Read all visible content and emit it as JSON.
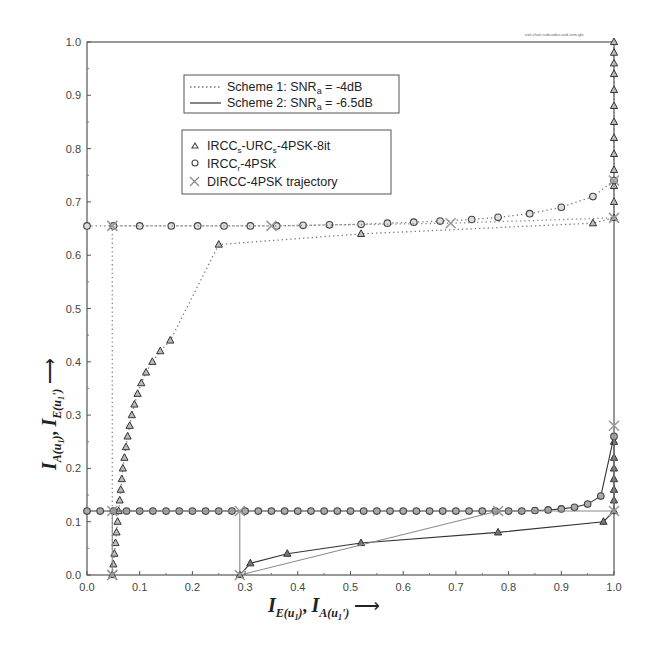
{
  "chart_data": {
    "type": "line",
    "title": "",
    "corner_note": "exit-chart-subcodes-and-sum-glo",
    "xlabel": "I_E(u1), I_A(u1')",
    "ylabel": "I_A(u1), I_E(u1')",
    "xlim": [
      0.0,
      1.0
    ],
    "ylim": [
      0.0,
      1.0
    ],
    "x_ticks": [
      "0.0",
      "0.1",
      "0.2",
      "0.3",
      "0.4",
      "0.5",
      "0.6",
      "0.7",
      "0.8",
      "0.9",
      "1.0"
    ],
    "y_ticks": [
      "0.0",
      "0.1",
      "0.2",
      "0.3",
      "0.4",
      "0.5",
      "0.6",
      "0.7",
      "0.8",
      "0.9",
      "1.0"
    ],
    "grid": false,
    "legend_line_styles": [
      {
        "style": "dotted",
        "label": "Scheme 1: SNR",
        "sub": "a",
        "suffix": " = -4dB"
      },
      {
        "style": "solid",
        "label": "Scheme 2: SNR",
        "sub": "a",
        "suffix": " = -6.5dB"
      }
    ],
    "legend_markers": [
      {
        "marker": "triangle",
        "label": "IRCC_s-URC_s-4PSK-8it"
      },
      {
        "marker": "circle",
        "label": "IRCC_r-4PSK"
      },
      {
        "marker": "x",
        "label": "DIRCC-4PSK trajectory"
      }
    ],
    "series": [
      {
        "name": "Scheme 1 IRCC_s-URC_s-4PSK-8it",
        "style": "dotted",
        "marker": "triangle",
        "x": [
          0.048,
          0.05,
          0.052,
          0.054,
          0.056,
          0.058,
          0.06,
          0.062,
          0.064,
          0.066,
          0.068,
          0.071,
          0.074,
          0.077,
          0.081,
          0.085,
          0.09,
          0.096,
          0.103,
          0.112,
          0.124,
          0.139,
          0.158,
          0.25,
          0.52,
          0.96,
          1.0,
          1.0,
          1.0,
          1.0,
          1.0,
          1.0,
          1.0,
          1.0,
          1.0,
          1.0,
          1.0,
          1.0,
          1.0
        ],
        "y": [
          0.0,
          0.02,
          0.04,
          0.06,
          0.08,
          0.1,
          0.12,
          0.14,
          0.16,
          0.18,
          0.2,
          0.22,
          0.24,
          0.26,
          0.28,
          0.3,
          0.32,
          0.34,
          0.36,
          0.38,
          0.4,
          0.42,
          0.44,
          0.62,
          0.64,
          0.66,
          0.67,
          0.7,
          0.73,
          0.76,
          0.79,
          0.82,
          0.85,
          0.88,
          0.91,
          0.94,
          0.96,
          0.98,
          1.0
        ]
      },
      {
        "name": "Scheme 1 IRCC_r-4PSK",
        "style": "dotted",
        "marker": "circle",
        "x": [
          0.0,
          0.05,
          0.1,
          0.16,
          0.21,
          0.26,
          0.31,
          0.36,
          0.41,
          0.46,
          0.52,
          0.57,
          0.62,
          0.67,
          0.73,
          0.78,
          0.84,
          0.9,
          0.96,
          1.0
        ],
        "y": [
          0.655,
          0.655,
          0.655,
          0.655,
          0.655,
          0.655,
          0.655,
          0.655,
          0.656,
          0.657,
          0.658,
          0.66,
          0.662,
          0.664,
          0.667,
          0.671,
          0.678,
          0.69,
          0.71,
          0.74
        ]
      },
      {
        "name": "Scheme 2 IRCC_s-URC_s-4PSK-8it",
        "style": "solid",
        "marker": "triangle",
        "x": [
          0.29,
          0.31,
          0.38,
          0.52,
          0.78,
          0.98,
          1.0,
          1.0,
          1.0,
          1.0,
          1.0,
          1.0,
          1.0
        ],
        "y": [
          0.0,
          0.022,
          0.04,
          0.06,
          0.08,
          0.1,
          0.12,
          0.14,
          0.16,
          0.18,
          0.2,
          0.22,
          0.25
        ]
      },
      {
        "name": "Scheme 2 IRCC_r-4PSK",
        "style": "solid",
        "marker": "circle",
        "x": [
          0.0,
          0.025,
          0.05,
          0.075,
          0.1,
          0.125,
          0.15,
          0.175,
          0.2,
          0.225,
          0.25,
          0.275,
          0.3,
          0.325,
          0.35,
          0.375,
          0.4,
          0.425,
          0.45,
          0.475,
          0.5,
          0.525,
          0.55,
          0.575,
          0.6,
          0.625,
          0.65,
          0.675,
          0.7,
          0.725,
          0.75,
          0.775,
          0.8,
          0.825,
          0.85,
          0.875,
          0.9,
          0.925,
          0.95,
          0.975,
          1.0
        ],
        "y": [
          0.12,
          0.12,
          0.12,
          0.12,
          0.12,
          0.12,
          0.12,
          0.12,
          0.12,
          0.12,
          0.12,
          0.12,
          0.12,
          0.12,
          0.12,
          0.12,
          0.12,
          0.12,
          0.12,
          0.12,
          0.12,
          0.12,
          0.12,
          0.12,
          0.12,
          0.12,
          0.12,
          0.12,
          0.12,
          0.12,
          0.12,
          0.12,
          0.12,
          0.12,
          0.121,
          0.122,
          0.124,
          0.127,
          0.133,
          0.148,
          0.26
        ]
      },
      {
        "name": "Scheme 1 DIRCC-4PSK trajectory",
        "style": "dotted",
        "marker": "x",
        "x": [
          0.048,
          0.048,
          0.35,
          0.69,
          1.0,
          1.0
        ],
        "y": [
          0.0,
          0.655,
          0.655,
          0.66,
          0.67,
          0.74
        ]
      },
      {
        "name": "Scheme 2 DIRCC-4PSK trajectory",
        "style": "solid",
        "marker": "x",
        "x": [
          0.048,
          0.048,
          0.29,
          0.29,
          0.78,
          1.0,
          1.0
        ],
        "y": [
          0.0,
          0.12,
          0.12,
          0.0,
          0.12,
          0.12,
          0.28
        ]
      }
    ]
  }
}
